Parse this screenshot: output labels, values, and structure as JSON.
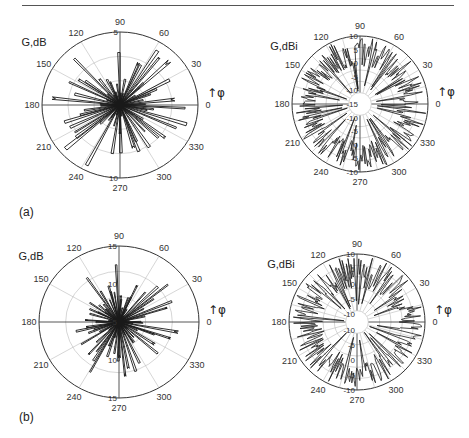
{
  "figure": {
    "panel_labels": [
      "(a)",
      "(b)"
    ]
  },
  "chart_data": [
    {
      "id": "a-left",
      "type": "polar-line",
      "panel": "(a)",
      "ylabel": "G,dB",
      "angle_label": "↑φ",
      "angle_ticks": [
        0,
        30,
        60,
        90,
        120,
        150,
        180,
        210,
        240,
        270,
        300,
        330
      ],
      "radial_ticks": [
        "5",
        "10"
      ],
      "radial_tick_positions": [
        5,
        10
      ],
      "rlim": [
        0,
        15
      ],
      "grid": true,
      "center": [
        120,
        105
      ],
      "rx": 78,
      "ry": 73,
      "lobes": 64,
      "seed": 11,
      "min_r": 2,
      "max_r": 14,
      "style": "spiky",
      "note": "Highly irregular multi-lobe pattern; lobes reach ~10–14 dB, many narrow spikes through origin"
    },
    {
      "id": "a-right",
      "type": "polar-line",
      "panel": "(a)",
      "ylabel": "G,dBi",
      "angle_label": "↑φ",
      "angle_ticks": [
        0,
        30,
        60,
        90,
        120,
        150,
        180,
        210,
        240,
        270,
        300,
        330
      ],
      "radial_ticks": [
        "10",
        "5",
        "0",
        "-5",
        "-10",
        "-15",
        "-10",
        "-5",
        "0",
        "-5",
        "-10"
      ],
      "radial_tick_values": [
        -15,
        -10,
        -5,
        0,
        5,
        10
      ],
      "rlim": [
        -20,
        10
      ],
      "grid": true,
      "center": [
        360,
        104
      ],
      "rx": 68,
      "ry": 68,
      "lobes": 120,
      "seed": 23,
      "min_r": 0.55,
      "max_r": 0.98,
      "style": "dense",
      "note": "Dense fine-lobe pattern concentrated near outer ring (0 to 10 dBi) with occasional deep nulls toward -15 dBi"
    },
    {
      "id": "b-left",
      "type": "polar-line",
      "panel": "(b)",
      "ylabel": "G,dB",
      "angle_label": "↑φ",
      "angle_ticks": [
        0,
        30,
        60,
        90,
        120,
        150,
        180,
        210,
        240,
        270,
        300,
        330
      ],
      "radial_ticks": [
        "15",
        "10",
        "5",
        "10",
        "15"
      ],
      "radial_tick_positions": [
        5,
        10,
        15
      ],
      "rlim": [
        0,
        15
      ],
      "grid": true,
      "center": [
        119,
        322
      ],
      "rx": 80,
      "ry": 76,
      "lobes": 72,
      "seed": 37,
      "min_r": 1.5,
      "max_r": 12,
      "style": "spiky",
      "note": "Irregular spiky pattern; max lobes ~12 dB toward 30–60° and 300–330°"
    },
    {
      "id": "b-right",
      "type": "polar-line",
      "panel": "(b)",
      "ylabel": "G,dBi",
      "angle_label": "↑φ",
      "angle_ticks": [
        0,
        30,
        60,
        90,
        120,
        150,
        180,
        210,
        240,
        270,
        300,
        330
      ],
      "radial_ticks": [
        "10",
        "5",
        "0",
        "-5",
        "-10",
        "-10",
        "-5",
        "0",
        "-5",
        "-10"
      ],
      "radial_tick_values": [
        -10,
        -5,
        0,
        5,
        10
      ],
      "rlim": [
        -15,
        10
      ],
      "grid": true,
      "center": [
        357,
        322
      ],
      "rx": 68,
      "ry": 68,
      "lobes": 110,
      "seed": 51,
      "min_r": 0.5,
      "max_r": 0.97,
      "style": "dense",
      "note": "Dense multi-lobe pattern near outer rings; deep nulls along ~100°, 180°, 240°, 300°"
    }
  ]
}
